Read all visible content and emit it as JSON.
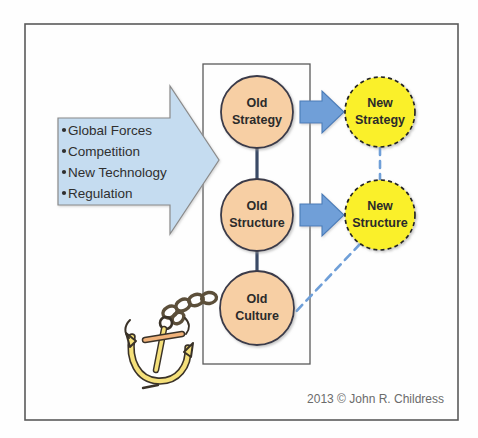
{
  "frame": {
    "outer_border_color": "#5a5a5a",
    "background_color": "#fefefe"
  },
  "driver_arrow": {
    "name": "external-forces-arrow",
    "fill_color": "#c5dcf0",
    "stroke_color": "#8a8a8a",
    "bullets": [
      "Global Forces",
      "Competition",
      "New Technology",
      "Regulation"
    ]
  },
  "organization_box": {
    "name": "organization-boundary",
    "stroke_color": "#5a5a5a"
  },
  "old_nodes": {
    "fill_color": "#f7cfa4",
    "stroke_color": "#3b3b4a",
    "items": [
      {
        "id": "old-strategy",
        "line1": "Old",
        "line2": "Strategy"
      },
      {
        "id": "old-structure",
        "line1": "Old",
        "line2": "Structure"
      },
      {
        "id": "old-culture",
        "line1": "Old",
        "line2": "Culture"
      }
    ]
  },
  "new_nodes": {
    "fill_color": "#faf029",
    "stroke_color": "#222222",
    "items": [
      {
        "id": "new-strategy",
        "line1": "New",
        "line2": "Strategy"
      },
      {
        "id": "new-structure",
        "line1": "New",
        "line2": "Structure"
      }
    ]
  },
  "transform_arrows": {
    "fill_color": "#6f9fd8",
    "stroke_color": "#4a7cb8",
    "count": 2
  },
  "connectors": {
    "spine_color": "#3a4a66",
    "dashed_color": "#6f9fd8"
  },
  "anchor": {
    "name": "anchor-icon",
    "body_color": "#f5e07a",
    "outline_color": "#3a3228",
    "chain_color": "#5c4f3a"
  },
  "credit": {
    "text": "2013 © John R. Childress"
  }
}
